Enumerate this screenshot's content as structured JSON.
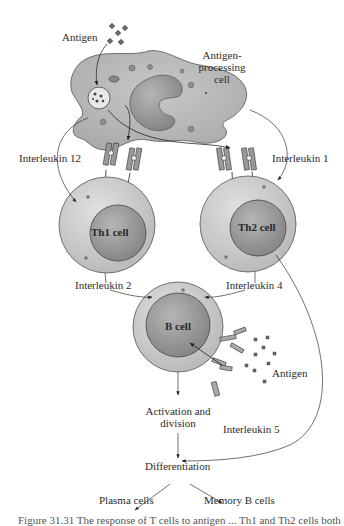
{
  "diagram": {
    "nodes": {
      "apc": {
        "label_line1": "Antigen-",
        "label_line2": "processing",
        "label_line3": "cell"
      },
      "th1": {
        "label": "Th1 cell"
      },
      "th2": {
        "label": "Th2 cell"
      },
      "bcell": {
        "label": "B cell"
      }
    },
    "labels": {
      "antigen_top": "Antigen",
      "antigen_bottom": "Antigen",
      "il12": "Interleukin 12",
      "il1": "Interleukin 1",
      "il2": "Interleukin 2",
      "il4": "Interleukin 4",
      "il5": "Interleukin 5",
      "activation_line1": "Activation and",
      "activation_line2": "division",
      "differentiation": "Differentiation",
      "plasma": "Plasma cells",
      "memory": "Memory B cells"
    },
    "edges": [
      {
        "from": "antigen",
        "to": "apc"
      },
      {
        "from": "apc",
        "to": "th1",
        "label": "Interleukin 12"
      },
      {
        "from": "apc",
        "to": "th2",
        "label": "Interleukin 1"
      },
      {
        "from": "th1",
        "to": "bcell",
        "label": "Interleukin 2"
      },
      {
        "from": "th2",
        "to": "bcell",
        "label": "Interleukin 4"
      },
      {
        "from": "antigen",
        "to": "bcell"
      },
      {
        "from": "bcell",
        "to": "activation"
      },
      {
        "from": "th2",
        "to": "activation",
        "label": "Interleukin 5"
      },
      {
        "from": "activation",
        "to": "differentiation"
      },
      {
        "from": "differentiation",
        "to": "plasma"
      },
      {
        "from": "differentiation",
        "to": "memory"
      }
    ],
    "colors": {
      "cell_outer": "#c9c9c9",
      "cell_nucleus": "#9a9a9a",
      "apc_body": "#b5b5b5",
      "line": "#333333"
    }
  },
  "caption": {
    "text": "Figure 31.31 The response of T cells to antigen ... Th1 and Th2 cells both"
  }
}
